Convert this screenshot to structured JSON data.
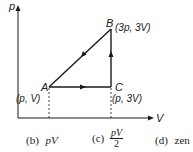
{
  "diagram": {
    "type": "pV-cycle",
    "axes": {
      "y_label": "p",
      "x_label": "V"
    },
    "points": [
      {
        "name": "A",
        "coord_label": "(p, V)"
      },
      {
        "name": "B",
        "coord_label": "(3p, 3V)"
      },
      {
        "name": "C",
        "coord_label": "(p, 3V)"
      }
    ],
    "process_arrows": [
      "A→C",
      "C→B",
      "B→A"
    ],
    "colors": {
      "line": "#1a1a1a",
      "background": "#ffffff"
    }
  },
  "options": [
    {
      "label": "(b)",
      "value": "pV"
    },
    {
      "label": "(c)",
      "numerator": "pV",
      "denominator": "2"
    },
    {
      "label": "(d)",
      "value": "zero",
      "visible_text": "zen"
    }
  ]
}
